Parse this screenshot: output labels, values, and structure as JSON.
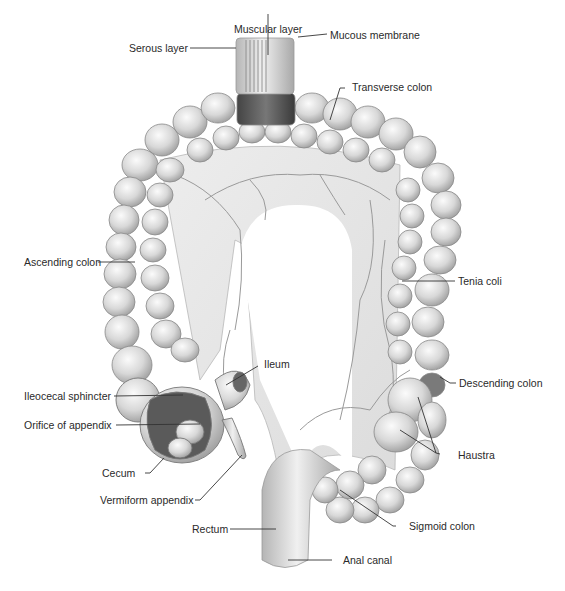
{
  "figure": {
    "colors": {
      "background": "#ffffff",
      "tissue": "#d9d9d9",
      "tissue_shadow": "#9a9a9a",
      "dark_cut": "#3b3b3b",
      "leader_line": "#333333",
      "text": "#2a2a2a"
    }
  },
  "labels": [
    {
      "id": "muscular-layer",
      "text": "Muscular layer"
    },
    {
      "id": "serous-layer",
      "text": "Serous layer"
    },
    {
      "id": "mucous-membrane",
      "text": "Mucous membrane"
    },
    {
      "id": "transverse-colon",
      "text": "Transverse colon"
    },
    {
      "id": "ascending-colon",
      "text": "Ascending colon"
    },
    {
      "id": "tenia-coli",
      "text": "Tenia coli"
    },
    {
      "id": "ileum",
      "text": "Ileum"
    },
    {
      "id": "ileocecal-sphincter",
      "text": "Ileocecal sphincter"
    },
    {
      "id": "descending-colon",
      "text": "Descending colon"
    },
    {
      "id": "orifice-of-appendix",
      "text": "Orifice of appendix"
    },
    {
      "id": "haustra",
      "text": "Haustra"
    },
    {
      "id": "cecum",
      "text": "Cecum"
    },
    {
      "id": "vermiform-appendix",
      "text": "Vermiform appendix"
    },
    {
      "id": "rectum",
      "text": "Rectum"
    },
    {
      "id": "sigmoid-colon",
      "text": "Sigmoid colon"
    },
    {
      "id": "anal-canal",
      "text": "Anal canal"
    }
  ]
}
